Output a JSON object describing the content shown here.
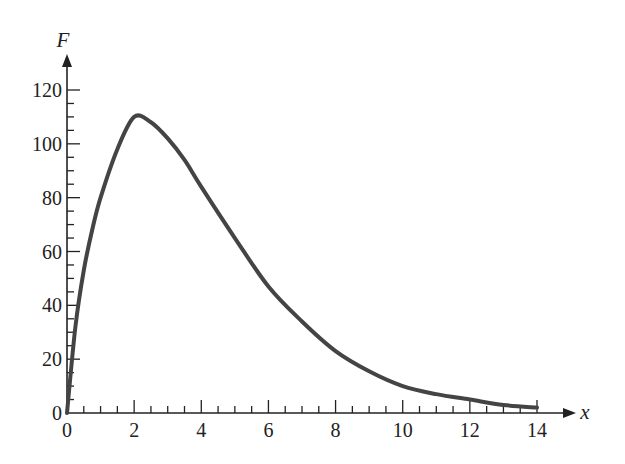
{
  "chart_data": {
    "type": "line",
    "title": "",
    "xlabel": "x",
    "ylabel": "F",
    "xlim": [
      0,
      14
    ],
    "ylim": [
      0,
      120
    ],
    "grid": false,
    "legend": null,
    "x_ticks": [
      0,
      2,
      4,
      6,
      8,
      10,
      12,
      14
    ],
    "x_tick_labels": [
      "0",
      "2",
      "4",
      "6",
      "8",
      "10",
      "12",
      "14"
    ],
    "x_minor_step": 0.5,
    "y_ticks": [
      0,
      20,
      40,
      60,
      80,
      100,
      120
    ],
    "y_tick_labels": [
      "0",
      "20",
      "40",
      "60",
      "80",
      "100",
      "120"
    ],
    "y_minor_step": 5,
    "series": [
      {
        "name": "F(x)",
        "color": "#444444",
        "x": [
          0,
          0.25,
          0.5,
          0.75,
          1,
          1.5,
          2,
          2.5,
          3,
          3.5,
          4,
          5,
          6,
          7,
          8,
          9,
          10,
          11,
          12,
          13,
          14
        ],
        "values": [
          0,
          32,
          53,
          68,
          80,
          98,
          110,
          108,
          102,
          94,
          84,
          65,
          47,
          34,
          23,
          15.5,
          10,
          7,
          5,
          3,
          2
        ]
      }
    ]
  },
  "labels": {
    "y_axis": "F",
    "x_axis": "x"
  }
}
